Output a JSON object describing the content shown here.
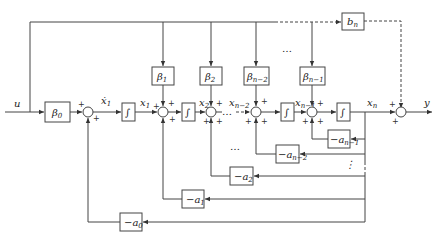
{
  "diagram": {
    "type": "state-space block diagram (observable canonical form)",
    "input_label": "u",
    "output_label": "y",
    "forward_gain": "β0",
    "feedthrough_gain": "b_n",
    "gains_beta": [
      "β1",
      "β2",
      "β_{n-2}",
      "β_{n-1}"
    ],
    "feedback_gains": [
      "-a0",
      "-a1",
      "-a2",
      "-a_{n-2}",
      "-a_{n-1}"
    ],
    "states": [
      "ẋ1",
      "x1",
      "x2",
      "x_{n-2}",
      "x_{n-1}",
      "x_n"
    ],
    "integrator_symbol": "∫",
    "sign_plus": "+",
    "ellipsis": "…"
  }
}
